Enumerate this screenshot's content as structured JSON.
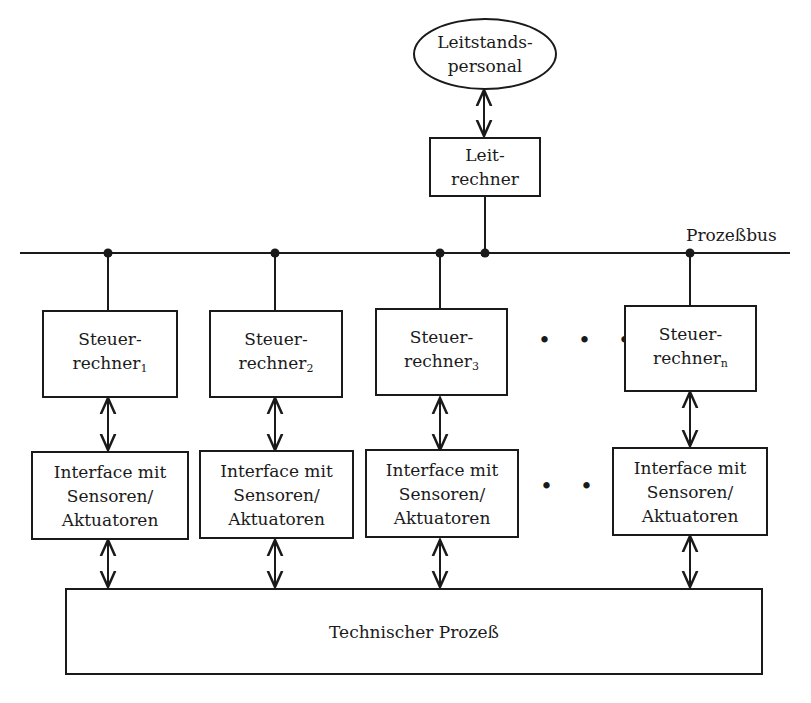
{
  "diagram": {
    "operator": {
      "line1": "Leitstands-",
      "line2": "personal"
    },
    "master_computer": {
      "line1": "Leit-",
      "line2": "rechner"
    },
    "bus_label": "Prozeßbus",
    "controllers": [
      {
        "line1": "Steuer-",
        "line2": "rechner",
        "index": "1"
      },
      {
        "line1": "Steuer-",
        "line2": "rechner",
        "index": "2"
      },
      {
        "line1": "Steuer-",
        "line2": "rechner",
        "index": "3"
      },
      {
        "line1": "Steuer-",
        "line2": "rechner",
        "index": "n"
      }
    ],
    "interfaces": [
      {
        "line1": "Interface mit",
        "line2": "Sensoren/",
        "line3": "Aktuatoren"
      },
      {
        "line1": "Interface mit",
        "line2": "Sensoren/",
        "line3": "Aktuatoren"
      },
      {
        "line1": "Interface mit",
        "line2": "Sensoren/",
        "line3": "Aktuatoren"
      },
      {
        "line1": "Interface mit",
        "line2": "Sensoren/",
        "line3": "Aktuatoren"
      }
    ],
    "ellipsis": "...",
    "process": "Technischer Prozeß"
  }
}
